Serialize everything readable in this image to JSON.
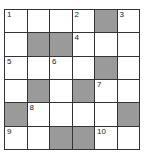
{
  "puzzle": {
    "rows": 6,
    "cols": 6,
    "block_color": "#9a9a9a",
    "cells": [
      [
        {
          "n": "1"
        },
        {
          "n": ""
        },
        {
          "n": ""
        },
        {
          "n": "2"
        },
        {
          "b": true
        },
        {
          "n": "3"
        }
      ],
      [
        {
          "n": ""
        },
        {
          "b": true
        },
        {
          "b": true
        },
        {
          "n": "4"
        },
        {
          "n": ""
        },
        {
          "n": ""
        }
      ],
      [
        {
          "n": "5"
        },
        {
          "n": ""
        },
        {
          "n": "6"
        },
        {
          "n": ""
        },
        {
          "b": true
        },
        {
          "n": ""
        }
      ],
      [
        {
          "n": ""
        },
        {
          "b": true
        },
        {
          "n": ""
        },
        {
          "b": true
        },
        {
          "n": "7"
        },
        {
          "n": ""
        }
      ],
      [
        {
          "b": true
        },
        {
          "n": "8"
        },
        {
          "n": ""
        },
        {
          "n": ""
        },
        {
          "n": ""
        },
        {
          "b": true
        }
      ],
      [
        {
          "n": "9"
        },
        {
          "n": ""
        },
        {
          "b": true
        },
        {
          "b": true
        },
        {
          "n": "10"
        },
        {
          "n": ""
        }
      ]
    ]
  }
}
